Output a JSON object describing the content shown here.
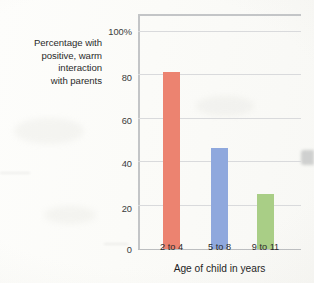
{
  "chart_data": {
    "type": "bar",
    "title": "",
    "categories": [
      "2 to 4",
      "5 to 8",
      "9 to 11"
    ],
    "values": [
      81,
      46,
      25
    ],
    "series": [
      {
        "name": "Percentage with positive, warm interaction with parents",
        "values": [
          81,
          46,
          25
        ],
        "colors": [
          "#ec8370",
          "#8fa8dd",
          "#a9ce86"
        ]
      }
    ],
    "xlabel": "Age of child in years",
    "ylabel": "Percentage with positive, warm interaction with parents",
    "ylim": [
      0,
      100
    ],
    "yticks": [
      0,
      20,
      40,
      60,
      80,
      100
    ],
    "ytick_labels": [
      "0",
      "20",
      "40",
      "60",
      "80",
      "100%"
    ],
    "grid": true,
    "legend": "none"
  },
  "axes": {
    "y_caption_lines": [
      "Percentage with",
      "positive, warm",
      "interaction",
      "with parents"
    ],
    "x_title": "Age of child in years"
  },
  "colors": {
    "bar_red": "#ec8370",
    "bar_blue": "#8fa8dd",
    "bar_green": "#a9ce86",
    "gridline": "#d9dadc",
    "axis": "#c3c5c7",
    "text": "#2b2b2b",
    "page_background": "#fdfdfb"
  }
}
